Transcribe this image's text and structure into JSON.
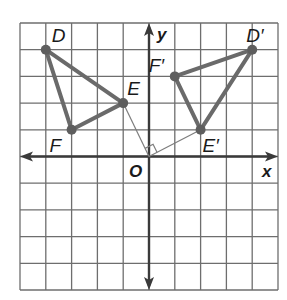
{
  "diagram": {
    "title": "",
    "type": "coordinate-plane-rotation",
    "grid": {
      "x_min": -5,
      "x_max": 5,
      "y_min": -5,
      "y_max": 5,
      "pixel_left": 20,
      "pixel_right": 278,
      "pixel_top": 23,
      "pixel_bottom": 290,
      "origin_px": [
        149,
        156
      ]
    },
    "axes": {
      "x_label": "x",
      "y_label": "y",
      "origin_label": "O"
    },
    "colors": {
      "grid": "#6e6e6e",
      "axis": "#3a3a3a",
      "triangle": "#6a6a6a",
      "ray": "#7d7d7d",
      "text": "#1a1a1a"
    },
    "triangles": [
      {
        "name": "DEF",
        "vertices": [
          {
            "label": "D",
            "x": -4,
            "y": 4,
            "label_dx": 6,
            "label_dy": -8
          },
          {
            "label": "E",
            "x": -1,
            "y": 2,
            "label_dx": 4,
            "label_dy": -8
          },
          {
            "label": "F",
            "x": -3,
            "y": 1,
            "label_dx": -22,
            "label_dy": 22
          }
        ]
      },
      {
        "name": "D'E'F'",
        "vertices": [
          {
            "label": "D′",
            "x": 4,
            "y": 4,
            "label_dx": -6,
            "label_dy": -8
          },
          {
            "label": "E′",
            "x": 2,
            "y": 1,
            "label_dx": 2,
            "label_dy": 22
          },
          {
            "label": "F′",
            "x": 1,
            "y": 3,
            "label_dx": -26,
            "label_dy": -4
          }
        ]
      }
    ],
    "rays": [
      {
        "from": "O",
        "to": "E",
        "x": -1,
        "y": 2
      },
      {
        "from": "O",
        "to": "E′",
        "x": 2,
        "y": 1
      }
    ],
    "right_angle_marker": {
      "at": "O",
      "between": [
        "E",
        "E′"
      ],
      "size": 9
    }
  }
}
